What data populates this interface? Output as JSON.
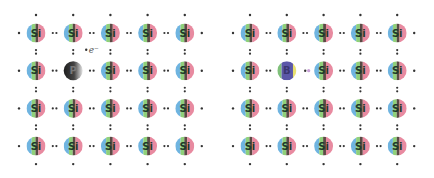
{
  "panels": [
    {
      "name": "n-type",
      "host_symbol": "Si",
      "dopant": {
        "symbol": "P",
        "row": 1,
        "col": 1,
        "style": "phosphorus"
      },
      "free_carrier": {
        "label": "e⁻",
        "type": "electron"
      },
      "rows": 4,
      "cols": 5
    },
    {
      "name": "p-type",
      "host_symbol": "Si",
      "dopant": {
        "symbol": "B",
        "row": 1,
        "col": 1,
        "style": "boron"
      },
      "free_carrier": {
        "label": "",
        "type": "hole"
      },
      "rows": 4,
      "cols": 5
    }
  ],
  "colors": {
    "si_left": "#6fb4e0",
    "si_mid": "#8fd07a",
    "si_dark": "#5a4a44",
    "si_right": "#e88aa0",
    "phosphorus_light": "#d8d8d8",
    "phosphorus_dark": "#2a2a2a",
    "boron_main": "#5b57a8",
    "boron_left": "#7fc07a",
    "boron_right": "#e8e070",
    "bond_dot": "#333333",
    "hole_dot": "#c9a0d8"
  }
}
